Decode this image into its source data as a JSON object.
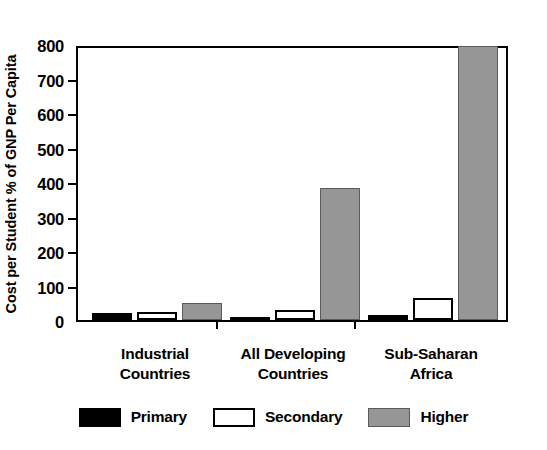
{
  "chart_data": {
    "type": "bar",
    "title": "",
    "subtitle": "",
    "xlabel": "",
    "ylabel": "Cost per Student % of GNP Per Capita",
    "ylim": [
      0,
      800
    ],
    "ytick_step": 100,
    "yticks": [
      "800",
      "700",
      "600",
      "500",
      "400",
      "300",
      "200",
      "100",
      "0"
    ],
    "ytick_values": [
      800,
      700,
      600,
      500,
      400,
      300,
      200,
      100,
      0
    ],
    "grid": false,
    "legend_position": "bottom",
    "categories": [
      "Industrial\nCountries",
      "All Developing\nCountries",
      "Sub-Saharan\nAfrica"
    ],
    "category_lines": [
      [
        "Industrial",
        "Countries"
      ],
      [
        "All Developing",
        "Countries"
      ],
      [
        "Sub-Saharan",
        "Africa"
      ]
    ],
    "series": [
      {
        "name": "Primary",
        "color": "#000000",
        "values": [
          20,
          9,
          14
        ]
      },
      {
        "name": "Secondary",
        "color": "#ffffff",
        "values": [
          22,
          28,
          64
        ]
      },
      {
        "name": "Higher",
        "color": "#969696",
        "values": [
          48,
          382,
          795
        ]
      }
    ]
  },
  "legend": {
    "items": [
      {
        "label": "Primary",
        "swatch": "primary"
      },
      {
        "label": "Secondary",
        "swatch": "secondary"
      },
      {
        "label": "Higher",
        "swatch": "higher"
      }
    ]
  },
  "colors": {
    "primary": "#000000",
    "secondary": "#ffffff",
    "higher": "#969696",
    "axis": "#000000",
    "background": "#ffffff"
  }
}
